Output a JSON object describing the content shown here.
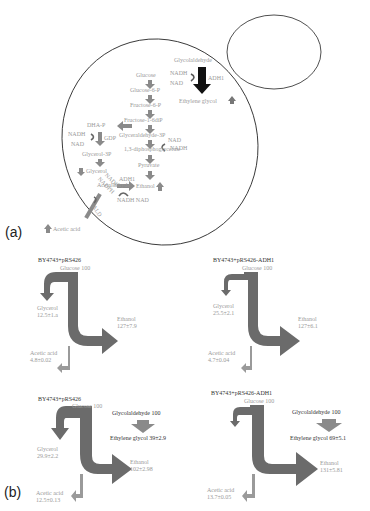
{
  "panel_a": {
    "label": "(a)",
    "metabolites": {
      "glycolaldehyde": "Glycolaldehyde",
      "glucose": "Glucose",
      "glucose6p": "Glucose-6-P",
      "fructose6p": "Fructose-6-P",
      "fructose16bp": "Fructose-1-6diP",
      "dhap": "DHA-P",
      "g3p": "Glyceraldehyde-3P",
      "bpg": "1,3-diphosphoglycerate",
      "glycerol3p": "Glycerol-3P",
      "glycerol": "Glycerol",
      "pyruvate": "Pyruvate",
      "acetaldehyde": "Acetaldehyde",
      "ethanol": "Ethanol",
      "acetic_acid": "Acetic acid",
      "ethylene_glycol": "Ethylene glycol"
    },
    "cofactors": {
      "nadh_top": "NADH",
      "nad_top": "NAD",
      "adh1_top": "ADH1",
      "nadh_left": "NADH",
      "nad_left": "NAD",
      "gdp": "GDP",
      "nad_mid": "NAD",
      "nadh_mid": "NADH",
      "nadp": "NADP",
      "nadph": "NADPH",
      "ald": "ALD",
      "adh1_eth": "ADH1",
      "nadh_nad_eth": "NADH NAD"
    }
  },
  "panel_b": {
    "label": "(b)",
    "flux_diagrams": [
      {
        "strain": "BY4743+pRS426",
        "glucose": "Glucose 100",
        "glycerol_name": "Glycerol",
        "glycerol_value": "12.5±1.a",
        "ethanol_name": "Ethanol",
        "ethanol_value": "127±7.9",
        "acetic_name": "Acetic acid",
        "acetic_value": "4.8±0.02"
      },
      {
        "strain": "BY4743+pRS426-ADH1",
        "glucose": "Glucose 100",
        "glycerol_name": "Glycerol",
        "glycerol_value": "25.5±2.1",
        "ethanol_name": "Ethanol",
        "ethanol_value": "127±6.1",
        "acetic_name": "Acetic acid",
        "acetic_value": "4.7±0.04"
      },
      {
        "strain": "BY4743+pRS426",
        "glucose": "Glucose 100",
        "glycolaldehyde": "Glycolaldehyde 100",
        "ethylene_glycol": "Ethylene glycol 39±2.9",
        "glycerol_name": "Glycerol",
        "glycerol_value": "29.9±2.2",
        "ethanol_name": "Ethanol",
        "ethanol_value": "102±2.98",
        "acetic_name": "Acetic acid",
        "acetic_value": "12.5±0.13"
      },
      {
        "strain": "BY4743+pRS426-ADH1",
        "glucose": "Glucose 100",
        "glycolaldehyde": "Glycolaldehyde 100",
        "ethylene_glycol": "Ethylene glycol 69±5.1",
        "glycerol_name": "Glycerol",
        "glycerol_value": "",
        "ethanol_name": "Ethanol",
        "ethanol_value": "131±5.81",
        "acetic_name": "Acetic acid",
        "acetic_value": "13.7±0.05"
      }
    ]
  },
  "colors": {
    "arrow_dark": "#6b6b6b",
    "arrow_light": "#9a9a9a",
    "arrow_black": "#111111",
    "text": "#9a9a9a",
    "outline": "#222222"
  }
}
